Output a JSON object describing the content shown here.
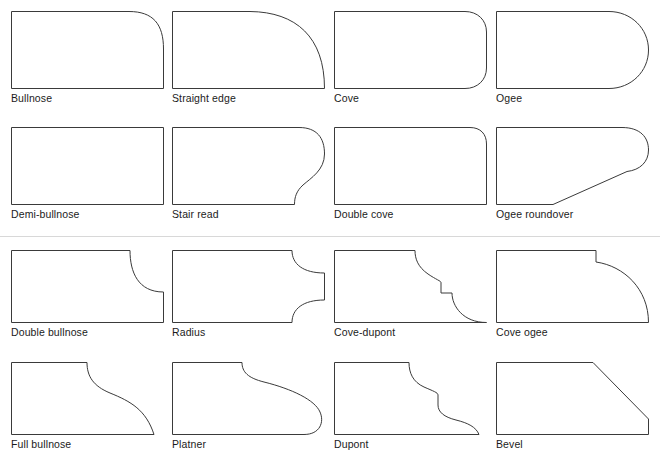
{
  "page": {
    "background_color": "#ffffff",
    "stroke_color": "#3a3a3a",
    "text_color": "#1b1b1b",
    "divider_color": "#d8d8d8",
    "columns": 4,
    "rows": 4,
    "total_shapes": 16
  },
  "divider": {
    "visible": true,
    "y": 236
  },
  "shapes": [
    {
      "index": 1,
      "label": "Bullnose",
      "icon": "edge-profile-bullnose-icon",
      "x": 11,
      "y": 11,
      "w": 153,
      "h": 78,
      "path": "M 0.5 0.5 L 118 0.5 C 142 0.5 152.5 13 152.5 38 L 152.5 77.5 L 0.5 77.5 Z"
    },
    {
      "index": 2,
      "label": "Straight edge",
      "icon": "edge-profile-straight-edge-icon",
      "x": 172,
      "y": 11,
      "w": 153,
      "h": 78,
      "path": "M 0.5 0.5 L 78 0.5 C 124 1 152.5 26 152.5 77.5 L 0.5 77.5 Z"
    },
    {
      "index": 3,
      "label": "Cove",
      "icon": "edge-profile-cove-icon",
      "x": 334,
      "y": 11,
      "w": 153,
      "h": 78,
      "path": "M 0.5 0.5 L 131 0.5 C 143.5 0.5 152.5 9 152.5 21 L 152.5 57 C 152.5 69 143.5 77.5 131 77.5 L 0.5 77.5 Z"
    },
    {
      "index": 4,
      "label": "Ogee",
      "icon": "edge-profile-ogee-icon",
      "x": 496,
      "y": 11,
      "w": 153,
      "h": 78,
      "path": "M 0.5 0.5 L 113 0.5 C 135 0.5 152.5 17.5 152.5 39 C 152.5 60.5 135 77.5 113 77.5 L 0.5 77.5 Z"
    },
    {
      "index": 5,
      "label": "Demi-bullnose",
      "icon": "edge-profile-demi-bullnose-icon",
      "x": 11,
      "y": 127,
      "w": 153,
      "h": 78,
      "path": "M 0.5 0.5 L 152.5 0.5 L 152.5 77.5 L 0.5 77.5 Z"
    },
    {
      "index": 6,
      "label": "Stair read",
      "icon": "edge-profile-stair-read-icon",
      "x": 172,
      "y": 127,
      "w": 153,
      "h": 78,
      "path": "M 0.5 0.5 L 127 0.5 C 145 0.5 152.5 11 152.5 27 C 152.5 43 139 51 131 58 C 124.5 64 122.5 70 122.5 77.5 L 0.5 77.5 Z"
    },
    {
      "index": 7,
      "label": "Double cove",
      "icon": "edge-profile-double-cove-icon",
      "x": 334,
      "y": 127,
      "w": 153,
      "h": 78,
      "path": "M 0.5 0.5 L 136 0.5 C 146.5 0.5 152.5 7 152.5 17 L 152.5 77.5 L 0.5 77.5 Z"
    },
    {
      "index": 8,
      "label": "Ogee roundover",
      "icon": "edge-profile-ogee-roundover-icon",
      "x": 496,
      "y": 127,
      "w": 153,
      "h": 78,
      "path": "M 0.5 0.5 L 126 0.5 C 144 0.5 152.5 10 152.5 23 C 152.5 35 144 43 131 44.5 L 57 77.5 L 0.5 77.5 Z"
    },
    {
      "index": 9,
      "label": "Double bullnose",
      "icon": "edge-profile-double-bullnose-icon",
      "x": 11,
      "y": 250,
      "w": 153,
      "h": 73,
      "path": "M 0.5 0.5 L 119 0.5 C 119 22 127 42 152.5 42 L 152.5 72.5 L 0.5 72.5 Z"
    },
    {
      "index": 10,
      "label": "Radius",
      "icon": "edge-profile-radius-icon",
      "x": 172,
      "y": 250,
      "w": 153,
      "h": 73,
      "path": "M 0.5 0.5 L 120 0.5 C 120 14 131 23 152.5 23 L 152.5 50 C 131 50 120 59 120 72.5 L 0.5 72.5 Z"
    },
    {
      "index": 11,
      "label": "Cove-dupont",
      "icon": "edge-profile-cove-dupont-icon",
      "x": 334,
      "y": 250,
      "w": 153,
      "h": 73,
      "path": "M 0.5 0.5 L 81 0.5 C 81 9 84 17 94 24 C 102 29.5 107 31 107 32.5 L 107 43 L 118 43 C 118 56 129 72.5 152.5 72.5 L 0.5 72.5 Z"
    },
    {
      "index": 12,
      "label": "Cove ogee",
      "icon": "edge-profile-cove-ogee-icon",
      "x": 496,
      "y": 250,
      "w": 153,
      "h": 73,
      "path": "M 0.5 0.5 L 100 0.5 L 100 12 C 128 16 152.5 39 152.5 72.5 L 0.5 72.5 Z"
    },
    {
      "index": 13,
      "label": "Full bullnose",
      "icon": "edge-profile-full-bullnose-icon",
      "x": 11,
      "y": 362,
      "w": 153,
      "h": 73,
      "path": "M 0.5 0.5 L 76 0.5 C 76 14 82 24 99 31 C 120 39.5 135 48 143 72.5 L 0.5 72.5 Z"
    },
    {
      "index": 14,
      "label": "Platner",
      "icon": "edge-profile-platner-icon",
      "x": 172,
      "y": 362,
      "w": 153,
      "h": 73,
      "path": "M 0.5 0.5 L 70 0.5 C 70 10 76 16 92 20 C 120 27 143 38 148 50 C 152.5 60 148 72.5 132 72.5 L 0.5 72.5 Z"
    },
    {
      "index": 15,
      "label": "Dupont",
      "icon": "edge-profile-dupont-icon",
      "x": 334,
      "y": 362,
      "w": 153,
      "h": 73,
      "path": "M 0.5 0.5 L 75 0.5 C 75 11 79 20 90 25 C 99 29 104 30.5 104 33 L 104 43 C 104 50 110 55 122 58 C 134 61 142 65 145 72.5 L 0.5 72.5 Z"
    },
    {
      "index": 16,
      "label": "Bevel",
      "icon": "edge-profile-bevel-icon",
      "x": 496,
      "y": 362,
      "w": 153,
      "h": 73,
      "path": "M 0.5 0.5 L 97 0.5 L 152.5 57 L 152.5 72.5 L 0.5 72.5 Z"
    }
  ]
}
